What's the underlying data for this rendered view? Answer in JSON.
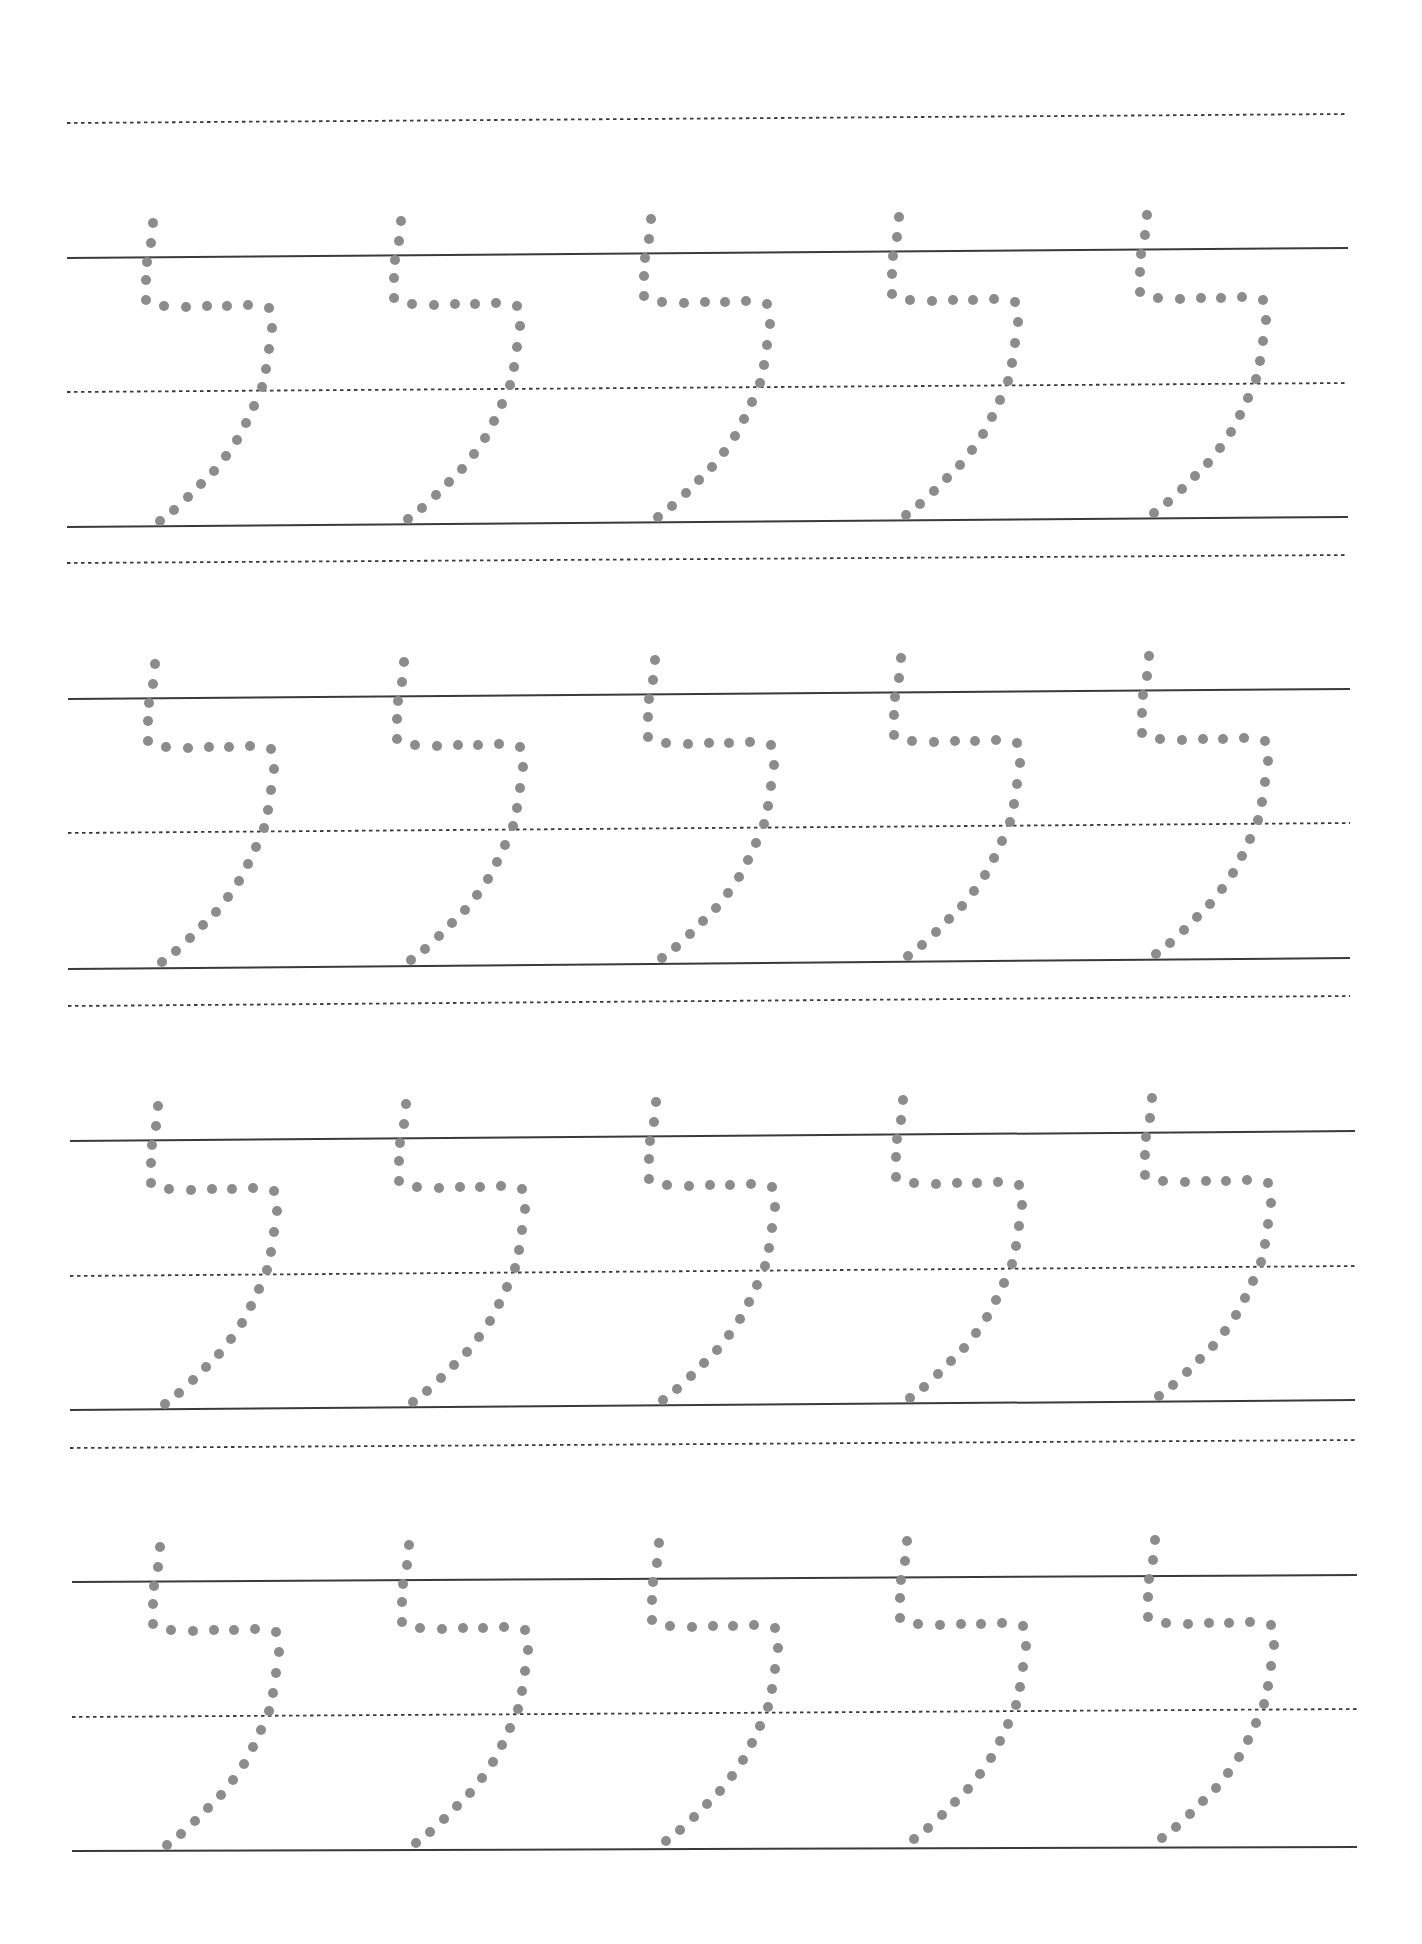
{
  "worksheet": {
    "letter": "ל",
    "letter_name": "Lamed",
    "colors": {
      "background": "#ffffff",
      "line": "#3a3a3a",
      "dot": "#8c8c8c"
    },
    "dot_radius": 5,
    "top_guide": {
      "x1": 67,
      "y1": 123,
      "x2": 1348,
      "y2": 114
    },
    "rows": [
      {
        "headline": {
          "x1": 67,
          "y1": 258,
          "x2": 1348,
          "y2": 248
        },
        "midline": {
          "x1": 67,
          "y1": 392,
          "x2": 1348,
          "y2": 383
        },
        "baseline": {
          "x1": 67,
          "y1": 527,
          "x2": 1348,
          "y2": 517
        },
        "descender": {
          "x1": 67,
          "y1": 563,
          "x2": 1348,
          "y2": 555
        },
        "letter_origins": [
          [
            147,
            258
          ],
          [
            395,
            256
          ],
          [
            645,
            254
          ],
          [
            893,
            252
          ],
          [
            1141,
            250
          ]
        ]
      },
      {
        "headline": {
          "x1": 68,
          "y1": 699,
          "x2": 1350,
          "y2": 689
        },
        "midline": {
          "x1": 68,
          "y1": 833,
          "x2": 1350,
          "y2": 823
        },
        "baseline": {
          "x1": 68,
          "y1": 969,
          "x2": 1350,
          "y2": 958
        },
        "descender": {
          "x1": 68,
          "y1": 1006,
          "x2": 1350,
          "y2": 996
        },
        "letter_origins": [
          [
            149,
            699
          ],
          [
            398,
            697
          ],
          [
            649,
            695
          ],
          [
            895,
            693
          ],
          [
            1143,
            691
          ]
        ]
      },
      {
        "headline": {
          "x1": 70,
          "y1": 1141,
          "x2": 1355,
          "y2": 1131
        },
        "midline": {
          "x1": 70,
          "y1": 1276,
          "x2": 1355,
          "y2": 1266
        },
        "baseline": {
          "x1": 70,
          "y1": 1410,
          "x2": 1355,
          "y2": 1400
        },
        "descender": {
          "x1": 70,
          "y1": 1448,
          "x2": 1355,
          "y2": 1440
        },
        "letter_origins": [
          [
            152,
            1141
          ],
          [
            400,
            1139
          ],
          [
            650,
            1137
          ],
          [
            897,
            1135
          ],
          [
            1146,
            1133
          ]
        ]
      },
      {
        "headline": {
          "x1": 72,
          "y1": 1582,
          "x2": 1357,
          "y2": 1575
        },
        "midline": {
          "x1": 72,
          "y1": 1717,
          "x2": 1357,
          "y2": 1709
        },
        "baseline": {
          "x1": 72,
          "y1": 1851,
          "x2": 1357,
          "y2": 1847
        },
        "descender": null,
        "letter_origins": [
          [
            154,
            1582
          ],
          [
            403,
            1580
          ],
          [
            653,
            1578
          ],
          [
            901,
            1576
          ],
          [
            1149,
            1575
          ]
        ]
      }
    ],
    "dot_pattern": [
      [
        6,
        -35
      ],
      [
        4,
        -15
      ],
      [
        0,
        4
      ],
      [
        -1,
        22
      ],
      [
        -1,
        42
      ],
      [
        17,
        48
      ],
      [
        39,
        49
      ],
      [
        60,
        48
      ],
      [
        80,
        48
      ],
      [
        101,
        47
      ],
      [
        122,
        50
      ],
      [
        125,
        70
      ],
      [
        122,
        91
      ],
      [
        119,
        111
      ],
      [
        115,
        129
      ],
      [
        107,
        148
      ],
      [
        99,
        165
      ],
      [
        90,
        182
      ],
      [
        79,
        198
      ],
      [
        67,
        213
      ],
      [
        54,
        226
      ],
      [
        41,
        239
      ],
      [
        27,
        252
      ],
      [
        13,
        263
      ]
    ]
  }
}
